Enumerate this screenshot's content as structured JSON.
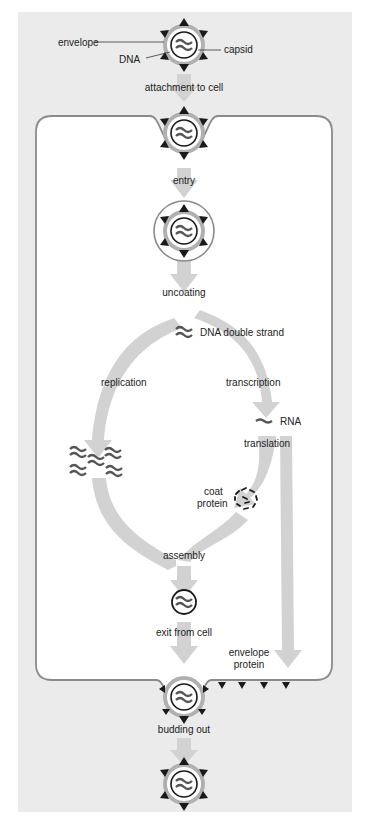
{
  "diagram": {
    "colors": {
      "panel_bg": "#ebebeb",
      "cell_bg": "#ffffff",
      "cell_border": "#8a8a8a",
      "arrow": "#d2d2d2",
      "dna": "#555555",
      "spike": "#1a1a1a",
      "envelope": "#b0b0b0"
    },
    "virion_labels": {
      "envelope": "envelope",
      "dna": "DNA",
      "capsid": "capsid"
    },
    "steps": {
      "attachment": "attachment to cell",
      "entry": "entry",
      "uncoating": "uncoating",
      "dna_double_strand": "DNA double strand",
      "replication": "replication",
      "transcription": "transcription",
      "rna": "RNA",
      "translation": "translation",
      "coat_protein_1": "coat",
      "coat_protein_2": "protein",
      "assembly": "assembly",
      "exit": "exit from cell",
      "envelope_protein_1": "envelope",
      "envelope_protein_2": "protein",
      "budding": "budding out"
    }
  }
}
